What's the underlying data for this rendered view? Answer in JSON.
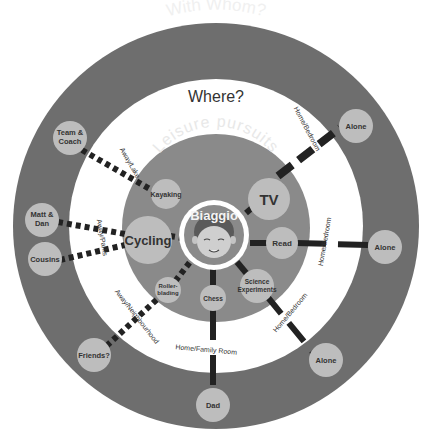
{
  "diagram": {
    "rings": {
      "outer_title": "With Whom?",
      "middle_title": "Where?",
      "inner_title": "Leisure pursuits"
    },
    "center": {
      "name": "Biaggio",
      "icon": "child-face-avatar"
    },
    "activities": [
      {
        "id": "kayaking",
        "label": "Kayaking"
      },
      {
        "id": "cycling",
        "label": "Cycling"
      },
      {
        "id": "tv",
        "label": "TV"
      },
      {
        "id": "read",
        "label": "Read"
      },
      {
        "id": "science",
        "label_line1": "Science",
        "label_line2": "Experiments"
      },
      {
        "id": "chess",
        "label": "Chess"
      },
      {
        "id": "rollerblading",
        "label_line1": "Roller-",
        "label_line2": "blading"
      }
    ],
    "places": [
      {
        "id": "away-lake",
        "label": "Away/Lake"
      },
      {
        "id": "away-parks",
        "label": "Away/Parks"
      },
      {
        "id": "home-bedroom-tv",
        "label": "Home/Bedroom"
      },
      {
        "id": "home-bedroom-read",
        "label": "Home/Bedroom"
      },
      {
        "id": "home-bedroom-science",
        "label": "Home/Bedroom"
      },
      {
        "id": "home-family-room",
        "label": "Home/Family Room"
      },
      {
        "id": "away-neighbourhood",
        "label": "Away/Neighbourhood"
      }
    ],
    "people": [
      {
        "id": "team-coach",
        "label_line1": "Team &",
        "label_line2": "Coach"
      },
      {
        "id": "matt-dan",
        "label_line1": "Matt &",
        "label_line2": "Dan"
      },
      {
        "id": "cousins",
        "label": "Cousins"
      },
      {
        "id": "alone-tv",
        "label": "Alone"
      },
      {
        "id": "alone-read",
        "label": "Alone"
      },
      {
        "id": "alone-science",
        "label": "Alone"
      },
      {
        "id": "dad",
        "label": "Dad"
      },
      {
        "id": "friends",
        "label": "Friends?"
      }
    ],
    "legend_styles": {
      "solid_line": "home",
      "dotted_line": "away"
    },
    "colors": {
      "outer_ring": "#6e6e6e",
      "middle_ring": "#ffffff",
      "inner_disk": "#8a8a8a",
      "node": "#bdbdbd",
      "connector": "#222222",
      "title_light": "#f0f0f0",
      "title_dark": "#333333"
    }
  }
}
